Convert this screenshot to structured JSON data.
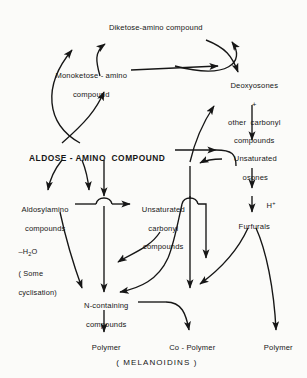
{
  "figure": {
    "caption": "( MELANOIDINS )",
    "ink_color": "#161616",
    "background_color": "#fbfbf9"
  },
  "nodes": {
    "diketose": "Diketose-amino compound",
    "monoketose_l1": "Monoketose - amino",
    "monoketose_l2": "compound",
    "deoxyosones_l1": "Deoxyosones",
    "deoxyosones_l2": "+",
    "deoxyosones_l3": "other  carbonyl",
    "deoxyosones_l4": "compounds",
    "aldose": "ALDOSE - AMINO  COMPOUND",
    "unsat_osones_l1": "Unsaturated",
    "unsat_osones_l2": "osones",
    "aldosylamino_l1": "Aldosylamino",
    "aldosylamino_l2": "compounds",
    "unsat_carbonyl_l1": "Unsaturated",
    "unsat_carbonyl_l2": "carbonyl",
    "unsat_carbonyl_l3": "compounds",
    "furfurals": "Furfurals",
    "n_containing_l1": "N-containing",
    "n_containing_l2": "compounds",
    "polymer_left": "Polymer",
    "copolymer": "Co - Polymer",
    "polymer_right": "Polymer"
  },
  "annotations": {
    "proton_h": "H",
    "proton_charge": "+",
    "dehydration_h": "–H",
    "dehydration_2": "2",
    "dehydration_o": "O",
    "cyclisation_l1": "( Some",
    "cyclisation_l2": "cyclisation)"
  }
}
